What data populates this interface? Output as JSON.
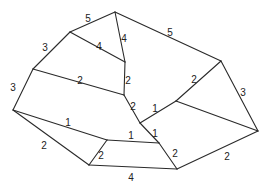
{
  "diagram": {
    "type": "weighted-planar-graph",
    "nodes": [
      {
        "id": "A",
        "x": 115,
        "y": 12
      },
      {
        "id": "B",
        "x": 70,
        "y": 32
      },
      {
        "id": "C",
        "x": 33,
        "y": 69
      },
      {
        "id": "D",
        "x": 13,
        "y": 110
      },
      {
        "id": "E",
        "x": 125,
        "y": 62
      },
      {
        "id": "F",
        "x": 124,
        "y": 95
      },
      {
        "id": "G",
        "x": 140,
        "y": 123
      },
      {
        "id": "H",
        "x": 176,
        "y": 101
      },
      {
        "id": "I",
        "x": 221,
        "y": 61
      },
      {
        "id": "J",
        "x": 258,
        "y": 131
      },
      {
        "id": "L",
        "x": 107,
        "y": 140
      },
      {
        "id": "M",
        "x": 159,
        "y": 143
      },
      {
        "id": "K",
        "x": 89,
        "y": 165
      },
      {
        "id": "N",
        "x": 177,
        "y": 169
      }
    ],
    "edges": [
      {
        "from": "B",
        "to": "A",
        "weight": "5",
        "lx": 88,
        "ly": 19
      },
      {
        "from": "A",
        "to": "I",
        "weight": "5",
        "lx": 170,
        "ly": 33
      },
      {
        "from": "A",
        "to": "E",
        "weight": "4",
        "lx": 124,
        "ly": 39
      },
      {
        "from": "B",
        "to": "E",
        "weight": "4",
        "lx": 99,
        "ly": 47
      },
      {
        "from": "C",
        "to": "B",
        "weight": "3",
        "lx": 45,
        "ly": 48
      },
      {
        "from": "D",
        "to": "C",
        "weight": "3",
        "lx": 13,
        "ly": 88
      },
      {
        "from": "C",
        "to": "F",
        "weight": "2",
        "lx": 80,
        "ly": 81
      },
      {
        "from": "E",
        "to": "F",
        "weight": "2",
        "lx": 128,
        "ly": 81
      },
      {
        "from": "F",
        "to": "G",
        "weight": "2",
        "lx": 133,
        "ly": 107
      },
      {
        "from": "G",
        "to": "H",
        "weight": "1",
        "lx": 155,
        "ly": 109
      },
      {
        "from": "I",
        "to": "H",
        "weight": "2",
        "lx": 194,
        "ly": 80
      },
      {
        "from": "I",
        "to": "J",
        "weight": "3",
        "lx": 243,
        "ly": 93
      },
      {
        "from": "H",
        "to": "J",
        "weight": "",
        "lx": 0,
        "ly": 0
      },
      {
        "from": "G",
        "to": "M",
        "weight": "1",
        "lx": 155,
        "ly": 134
      },
      {
        "from": "D",
        "to": "L",
        "weight": "1",
        "lx": 68,
        "ly": 123
      },
      {
        "from": "L",
        "to": "M",
        "weight": "1",
        "lx": 131,
        "ly": 136
      },
      {
        "from": "D",
        "to": "K",
        "weight": "2",
        "lx": 44,
        "ly": 146
      },
      {
        "from": "L",
        "to": "K",
        "weight": "2",
        "lx": 101,
        "ly": 156
      },
      {
        "from": "K",
        "to": "N",
        "weight": "4",
        "lx": 131,
        "ly": 178
      },
      {
        "from": "M",
        "to": "N",
        "weight": "2",
        "lx": 175,
        "ly": 154
      },
      {
        "from": "N",
        "to": "J",
        "weight": "2",
        "lx": 227,
        "ly": 157
      }
    ]
  }
}
